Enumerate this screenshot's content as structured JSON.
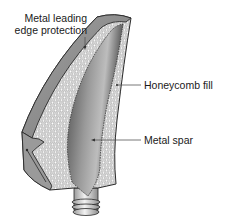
{
  "diagram": {
    "labels": {
      "leading_edge_line1": "Metal leading",
      "leading_edge_line2": "edge protection",
      "honeycomb": "Honeycomb fill",
      "spar": "Metal spar"
    },
    "colors": {
      "outline": "#2a2a2a",
      "leading_edge_band": "#8c8c8c",
      "honeycomb_bg": "#d9d9d9",
      "honeycomb_cell": "#ffffff",
      "spar_dark": "#3c3c3c",
      "spar_light": "#b8b8b8",
      "root_fitting": "#cfcfcf",
      "leader_line": "#555555"
    }
  }
}
